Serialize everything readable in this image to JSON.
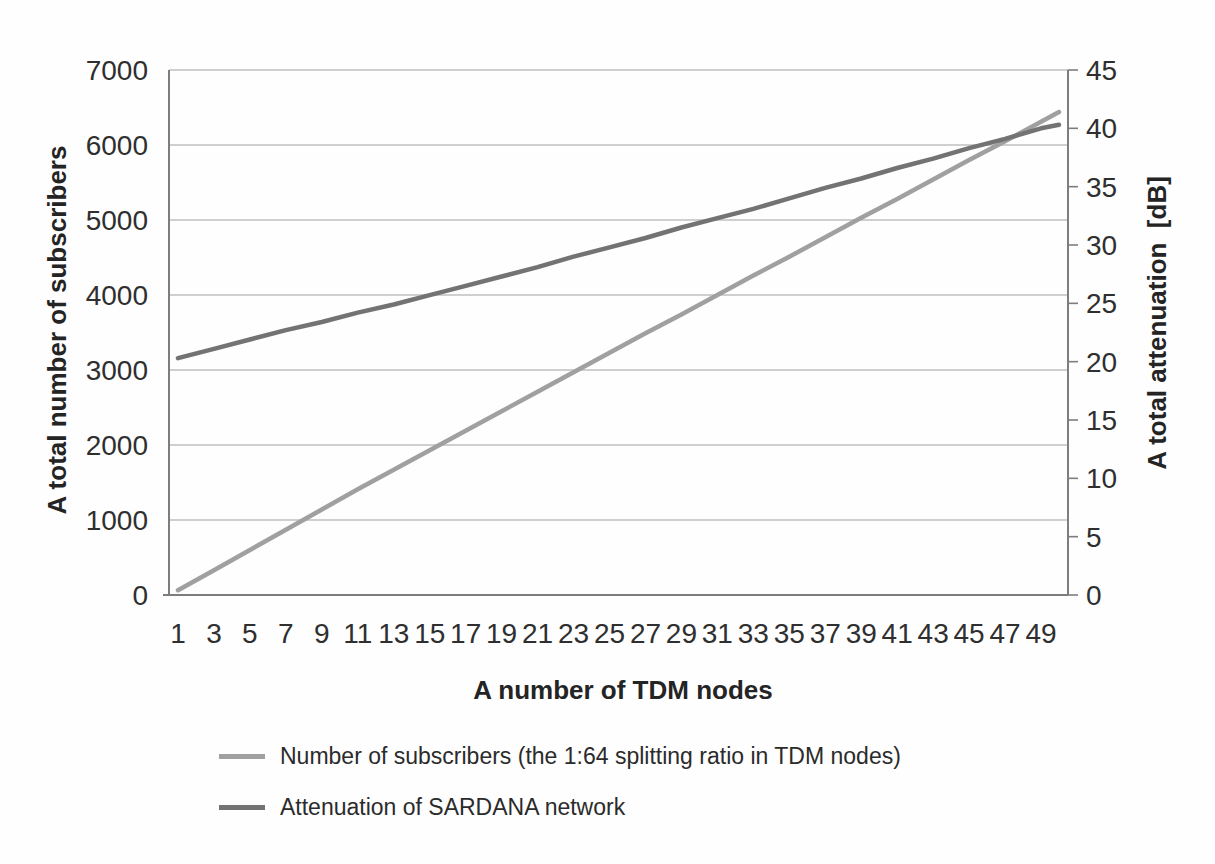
{
  "chart_data": {
    "type": "line",
    "title": "",
    "xlabel": "A number of TDM nodes",
    "ylabel_left": "A total number of subscribers",
    "ylabel_right": "A total attenuation  [dB]",
    "x": [
      1,
      3,
      5,
      7,
      9,
      11,
      13,
      15,
      17,
      19,
      21,
      23,
      25,
      27,
      29,
      31,
      33,
      35,
      37,
      39,
      41,
      43,
      45,
      47,
      49,
      50
    ],
    "x_tick_labels": [
      "1",
      "3",
      "5",
      "7",
      "9",
      "11",
      "13",
      "15",
      "17",
      "19",
      "21",
      "23",
      "25",
      "27",
      "29",
      "31",
      "33",
      "35",
      "37",
      "39",
      "41",
      "43",
      "45",
      "47",
      "49"
    ],
    "y_left": {
      "min": 0,
      "max": 7000,
      "step": 1000,
      "ticks": [
        0,
        1000,
        2000,
        3000,
        4000,
        5000,
        6000,
        7000
      ]
    },
    "y_right": {
      "min": 0,
      "max": 45,
      "step": 5,
      "ticks": [
        0,
        5,
        10,
        15,
        20,
        25,
        30,
        35,
        40,
        45
      ]
    },
    "grid": true,
    "legend_position": "bottom-left",
    "series": [
      {
        "name": "Number of subscribers (the 1:64 splitting ratio in TDM nodes)",
        "axis": "left",
        "color": "#a0a0a0",
        "values": [
          64,
          330,
          600,
          870,
          1140,
          1410,
          1670,
          1930,
          2190,
          2450,
          2710,
          2970,
          3230,
          3490,
          3740,
          4000,
          4260,
          4510,
          4770,
          5030,
          5280,
          5540,
          5800,
          6050,
          6310,
          6440
        ]
      },
      {
        "name": "Attenuation of SARDANA network",
        "axis": "right",
        "color": "#737373",
        "values": [
          20.3,
          21.1,
          21.9,
          22.7,
          23.4,
          24.2,
          24.9,
          25.7,
          26.5,
          27.3,
          28.1,
          29.0,
          29.8,
          30.6,
          31.5,
          32.3,
          33.1,
          34.0,
          34.9,
          35.7,
          36.6,
          37.4,
          38.3,
          39.1,
          40.0,
          40.3
        ]
      }
    ],
    "colors": {
      "gridline": "#9f9f9f",
      "axis_line": "#7d7d7d",
      "tick_text": "#2f2f2f"
    }
  }
}
